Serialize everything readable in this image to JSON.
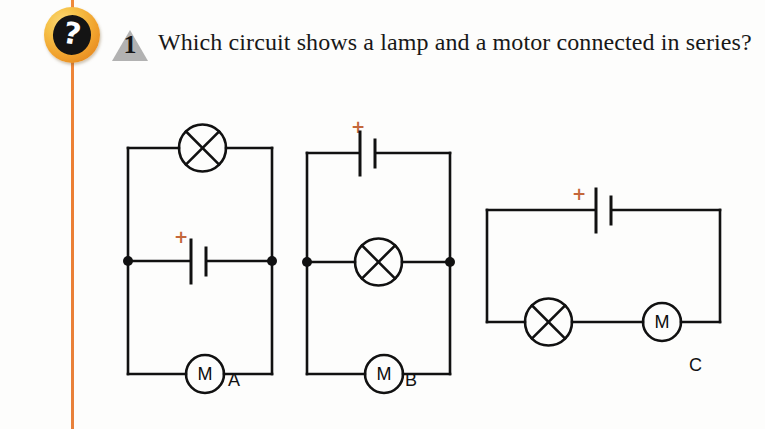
{
  "page": {
    "background_color": "#fdfdfc",
    "margin_rule_color": "#ec7f33"
  },
  "badge": {
    "icon": "question-mark-badge",
    "glyph": "?",
    "sphere_color": "#f0a02c",
    "inner_color": "#141414"
  },
  "question": {
    "number": "1",
    "number_shape": "triangle",
    "triangle_color": "#b2b2b2",
    "text": "Which circuit shows a lamp and a motor connected in series?"
  },
  "circuits": [
    {
      "id": "A",
      "label": "A",
      "battery_sign": "+",
      "sign_color": "#c4673b",
      "components": [
        "lamp",
        "battery",
        "motor"
      ],
      "motor_letter": "M",
      "topology": "lamp on top branch, battery on middle branch, motor on bottom branch (parallel)",
      "has_junction_dots": true
    },
    {
      "id": "B",
      "label": "B",
      "battery_sign": "+",
      "sign_color": "#c4673b",
      "components": [
        "battery",
        "lamp",
        "motor"
      ],
      "motor_letter": "M",
      "topology": "battery on top branch, lamp on middle branch, motor on bottom branch (parallel)",
      "has_junction_dots": true
    },
    {
      "id": "C",
      "label": "C",
      "battery_sign": "+",
      "sign_color": "#c4673b",
      "components": [
        "battery",
        "lamp",
        "motor"
      ],
      "motor_letter": "M",
      "topology": "battery on top, lamp and motor in series on bottom (single loop)",
      "has_junction_dots": false
    }
  ]
}
